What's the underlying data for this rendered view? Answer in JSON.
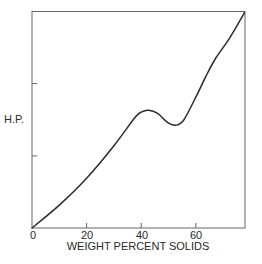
{
  "chart_data": {
    "type": "line",
    "title": "",
    "xlabel": "WEIGHT PERCENT SOLIDS",
    "ylabel": "H.P.",
    "xlim": [
      0,
      78
    ],
    "ylim": [
      0,
      100
    ],
    "x_ticks": [
      0,
      20,
      40,
      60
    ],
    "x_tick_labels": [
      "0",
      "20",
      "40",
      "60"
    ],
    "y_ticks": [
      33.3,
      66.7
    ],
    "y_tick_labels": [
      "",
      ""
    ],
    "grid": false,
    "legend": null,
    "series": [
      {
        "name": "H.P. vs weight percent solids",
        "x": [
          0,
          10,
          20,
          30,
          37.5,
          40,
          42.7,
          46,
          49.6,
          52.6,
          55.5,
          60,
          63.5,
          67.2,
          72.3,
          77.8
        ],
        "y": [
          0,
          10.6,
          23,
          38,
          50.7,
          53.5,
          54.4,
          53,
          48.8,
          47.5,
          49.8,
          60.4,
          69.6,
          78.3,
          87.6,
          99.5
        ]
      }
    ],
    "annotations": []
  },
  "labels": {
    "x_axis_title": "WEIGHT PERCENT SOLIDS",
    "y_axis_title": "H.P.",
    "x_tick_0": "0",
    "x_tick_1": "20",
    "x_tick_2": "40",
    "x_tick_3": "60"
  },
  "colors": {
    "line": "#2b2b2b",
    "axis": "#555555",
    "background": "#ffffff"
  }
}
